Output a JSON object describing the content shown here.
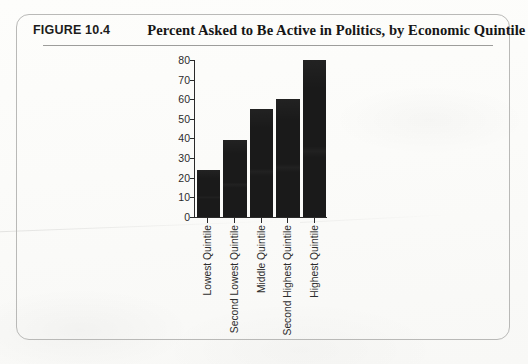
{
  "figure": {
    "number_label": "FIGURE 10.4",
    "title": "Percent Asked to Be Active in Politics, by Economic Quintile"
  },
  "chart_data": {
    "type": "bar",
    "title": "Percent Asked to Be Active in Politics, by Economic Quintile",
    "categories": [
      "Lowest Quintile",
      "Second Lowest Quintile",
      "Middle Quintile",
      "Second Highest Quintile",
      "Highest Quintile"
    ],
    "values": [
      24,
      39,
      55,
      60,
      80
    ],
    "xlabel": "",
    "ylabel": "",
    "ylim": [
      0,
      80
    ],
    "ytick_labels": [
      "0",
      "10",
      "20",
      "30",
      "40",
      "50",
      "60",
      "70",
      "80"
    ],
    "ytick_values": [
      0,
      10,
      20,
      30,
      40,
      50,
      60,
      70,
      80
    ],
    "grid": false,
    "legend": false,
    "bar_color": "#1a1a1a"
  }
}
